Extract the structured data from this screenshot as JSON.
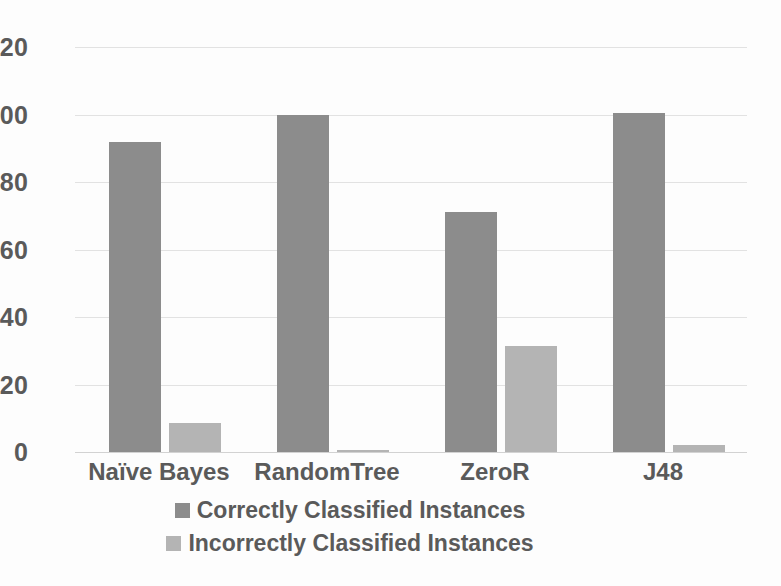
{
  "chart_data": {
    "type": "bar",
    "title": "",
    "xlabel": "",
    "ylabel": "",
    "ylim": [
      0,
      120
    ],
    "yticks": [
      0,
      20,
      40,
      60,
      80,
      100,
      120
    ],
    "grid": true,
    "legend_position": "bottom",
    "categories": [
      "Naïve Bayes",
      "RandomTree",
      "ZeroR",
      "J48"
    ],
    "series": [
      {
        "name": "Correctly Classified Instances",
        "color": "#8c8c8c",
        "values": [
          92,
          100,
          71,
          100.5
        ]
      },
      {
        "name": "Incorrectly Classified Instances",
        "color": "#b4b4b4",
        "values": [
          8.5,
          0.5,
          31.5,
          2
        ]
      }
    ]
  },
  "axis": {
    "tick_labels": [
      "120",
      "100",
      "80",
      "60",
      "40",
      "20",
      "0"
    ]
  },
  "legend": {
    "items": [
      {
        "label": "Correctly Classified Instances",
        "color": "#8c8c8c"
      },
      {
        "label": "Incorrectly Classified Instances",
        "color": "#b4b4b4"
      }
    ]
  },
  "colors": {
    "background": "#fdfdfd",
    "text": "#5a5a5a",
    "gridline": "#e2e2e2",
    "series_correct": "#8c8c8c",
    "series_incorrect": "#b4b4b4"
  }
}
